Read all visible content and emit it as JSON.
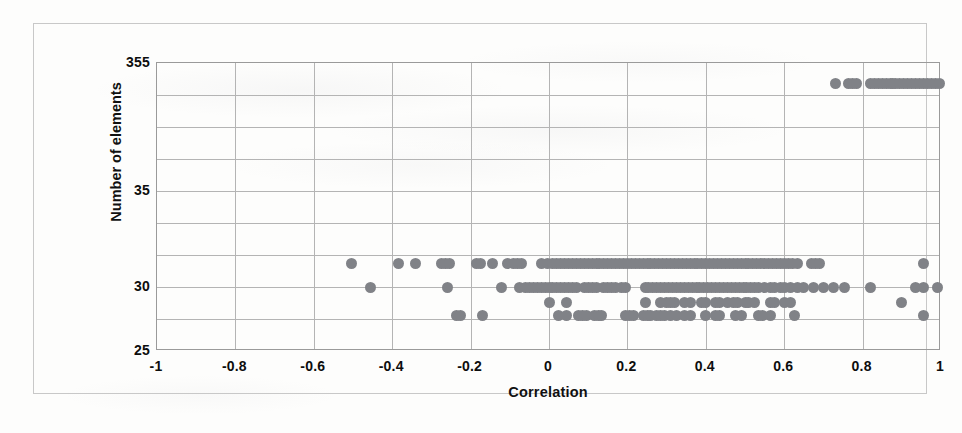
{
  "chart_data": {
    "type": "scatter",
    "title": "",
    "xlabel": "Correlation",
    "ylabel": "Number of elements",
    "xlim": [
      -1,
      1
    ],
    "xticks": [
      "-1",
      "-0.8",
      "-0.6",
      "-0.4",
      "-0.2",
      "0",
      "0.2",
      "0.4",
      "0.6",
      "0.8",
      "1"
    ],
    "xtick_values": [
      -1,
      -0.8,
      -0.6,
      -0.4,
      -0.2,
      0,
      0.2,
      0.4,
      0.6,
      0.8,
      1
    ],
    "yticks": [
      "355",
      "35",
      "30",
      "25"
    ],
    "ytick_values": [
      355,
      35,
      30,
      25
    ],
    "ytick_positions": [
      38,
      166,
      262,
      326
    ],
    "y_gridline_positions": [
      38,
      70,
      102,
      134,
      166,
      198,
      230,
      262,
      294,
      326
    ],
    "grid": true,
    "legend": null,
    "marker_color": "#808287",
    "marker_size": 11,
    "axis_note": "Broken / non-linear y axis: labelled values 355, 35, 30, 25. Points occupy discrete element-count rows 355, 31, 30, 29, 28.",
    "row_levels": [
      {
        "value": 355,
        "y_px": 58
      },
      {
        "value": 31,
        "y_px": 238
      },
      {
        "value": 30,
        "y_px": 262
      },
      {
        "value": 29,
        "y_px": 277
      },
      {
        "value": 28,
        "y_px": 290
      }
    ],
    "series": [
      {
        "name": "elements-355",
        "y": 355,
        "x": [
          0.73,
          0.765,
          0.775,
          0.785,
          0.82,
          0.83,
          0.84,
          0.85,
          0.86,
          0.87,
          0.875,
          0.885,
          0.895,
          0.905,
          0.915,
          0.925,
          0.935,
          0.945,
          0.955,
          0.965,
          0.975,
          0.985,
          0.995
        ]
      },
      {
        "name": "elements-31",
        "y": 31,
        "x": [
          -0.505,
          -0.385,
          -0.34,
          -0.275,
          -0.265,
          -0.255,
          -0.185,
          -0.175,
          -0.145,
          -0.105,
          -0.09,
          -0.08,
          -0.07,
          -0.02,
          -0.005,
          0.01,
          0.02,
          0.03,
          0.04,
          0.05,
          0.06,
          0.07,
          0.08,
          0.09,
          0.1,
          0.11,
          0.12,
          0.13,
          0.14,
          0.15,
          0.16,
          0.17,
          0.18,
          0.19,
          0.2,
          0.21,
          0.22,
          0.23,
          0.24,
          0.25,
          0.26,
          0.27,
          0.28,
          0.29,
          0.3,
          0.31,
          0.32,
          0.33,
          0.34,
          0.35,
          0.36,
          0.37,
          0.38,
          0.39,
          0.4,
          0.41,
          0.42,
          0.43,
          0.44,
          0.45,
          0.46,
          0.47,
          0.48,
          0.49,
          0.5,
          0.51,
          0.52,
          0.53,
          0.54,
          0.55,
          0.56,
          0.57,
          0.58,
          0.59,
          0.6,
          0.61,
          0.62,
          0.635,
          0.67,
          0.68,
          0.69,
          0.955
        ]
      },
      {
        "name": "elements-30",
        "y": 30,
        "x": [
          -0.455,
          -0.26,
          -0.12,
          -0.075,
          -0.06,
          -0.05,
          -0.04,
          -0.03,
          -0.02,
          -0.01,
          0.0,
          0.01,
          0.02,
          0.03,
          0.04,
          0.05,
          0.06,
          0.07,
          0.09,
          0.1,
          0.11,
          0.12,
          0.14,
          0.15,
          0.16,
          0.17,
          0.185,
          0.195,
          0.245,
          0.255,
          0.265,
          0.275,
          0.285,
          0.295,
          0.305,
          0.315,
          0.325,
          0.335,
          0.345,
          0.355,
          0.365,
          0.375,
          0.385,
          0.395,
          0.405,
          0.415,
          0.425,
          0.435,
          0.445,
          0.455,
          0.465,
          0.475,
          0.485,
          0.495,
          0.505,
          0.515,
          0.525,
          0.535,
          0.55,
          0.565,
          0.575,
          0.59,
          0.6,
          0.615,
          0.635,
          0.65,
          0.675,
          0.7,
          0.725,
          0.755,
          0.82,
          0.935,
          0.955,
          0.99
        ]
      },
      {
        "name": "elements-29",
        "y": 29,
        "x": [
          0.0,
          0.045,
          0.245,
          0.285,
          0.3,
          0.31,
          0.32,
          0.345,
          0.36,
          0.39,
          0.4,
          0.425,
          0.435,
          0.455,
          0.47,
          0.48,
          0.5,
          0.51,
          0.525,
          0.565,
          0.575,
          0.6,
          0.615,
          0.9
        ]
      },
      {
        "name": "elements-28",
        "y": 28,
        "x": [
          -0.235,
          -0.225,
          -0.17,
          0.025,
          0.045,
          0.075,
          0.085,
          0.095,
          0.115,
          0.125,
          0.135,
          0.195,
          0.205,
          0.215,
          0.24,
          0.25,
          0.26,
          0.275,
          0.285,
          0.295,
          0.31,
          0.325,
          0.345,
          0.36,
          0.4,
          0.425,
          0.435,
          0.475,
          0.49,
          0.535,
          0.545,
          0.565,
          0.625,
          0.955
        ]
      }
    ]
  }
}
